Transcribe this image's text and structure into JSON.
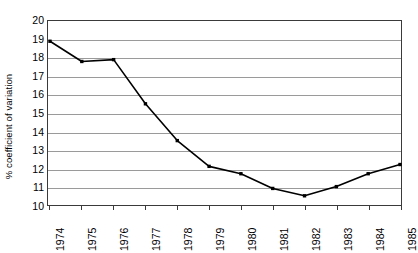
{
  "chart_data": {
    "type": "line",
    "title": "",
    "subtitle": "",
    "xlabel": "",
    "ylabel": "% coefficient of variation",
    "categories": [
      "1974",
      "1975",
      "1976",
      "1977",
      "1978",
      "1979",
      "1980",
      "1981",
      "1982",
      "1983",
      "1984",
      "1985"
    ],
    "values": [
      18.9,
      17.8,
      17.9,
      15.5,
      13.5,
      12.1,
      11.7,
      10.9,
      10.5,
      11.0,
      11.7,
      12.2
    ],
    "series": [
      {
        "name": "% coefficient of variation",
        "values": [
          18.9,
          17.8,
          17.9,
          15.5,
          13.5,
          12.1,
          11.7,
          10.9,
          10.5,
          11.0,
          11.7,
          12.2
        ]
      }
    ],
    "ylim": [
      10,
      20
    ],
    "xlim": [
      "1974",
      "1985"
    ],
    "y_ticks": [
      10,
      11,
      12,
      13,
      14,
      15,
      16,
      17,
      18,
      19,
      20
    ],
    "y_tick_labels": [
      "10",
      "11",
      "12",
      "13",
      "14",
      "15",
      "16",
      "17",
      "18",
      "19",
      "20"
    ],
    "x_tick_labels": [
      "1974",
      "1975",
      "1976",
      "1977",
      "1978",
      "1979",
      "1980",
      "1981",
      "1982",
      "1983",
      "1984",
      "1985"
    ],
    "grid": true,
    "grid_axis": "y",
    "legend": false,
    "legend_position": "none",
    "marker": "square",
    "line_color": "#000000",
    "marker_color": "#000000",
    "grid_color": "#9a9a9a",
    "axis_color": "#3a3a3a",
    "background_color": "#ffffff",
    "x_label_rotation": 90,
    "annotations": []
  }
}
